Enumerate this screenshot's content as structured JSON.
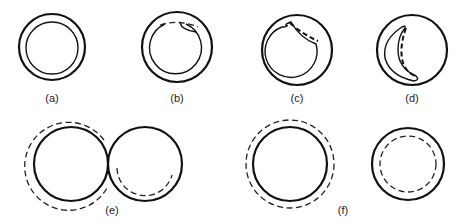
{
  "figure": {
    "panels": [
      {
        "id": "a",
        "label": "(a)",
        "description": "Ring: outer solid circle with concentric inner solid circle"
      },
      {
        "id": "b",
        "label": "(b)",
        "description": "Ring with small dashed notch at top right of inner wall"
      },
      {
        "id": "c",
        "label": "(c)",
        "description": "Ring with larger wedge cut into inner wall, dashed arc showing original boundary"
      },
      {
        "id": "d",
        "label": "(d)",
        "description": "Circle containing crescent-shaped cavity with dashed inner edge"
      },
      {
        "id": "e",
        "label": "(e)",
        "description": "Two touching circles; left circle with dashed outer offset, right circle with dashed inner lower arc"
      },
      {
        "id": "f",
        "label": "(f)",
        "description": "Two separate circles; left with dashed outer concentric circle, right with dashed inner concentric circle"
      }
    ],
    "colors": {
      "stroke": "#111111",
      "background": "#ffffff"
    }
  }
}
